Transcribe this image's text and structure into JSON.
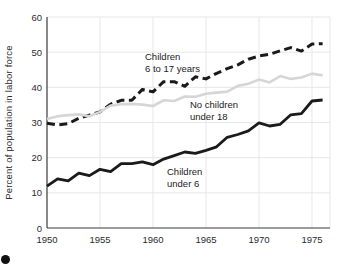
{
  "colors": {
    "background": "#ffffff",
    "grid": "#e7e7e7",
    "axis": "#3a3a3a",
    "tick_text": "#2b2b2b",
    "bullet": "#111111"
  },
  "chart_data": {
    "type": "line",
    "title": "",
    "xlabel": "",
    "ylabel": "Percent of population in labor force",
    "xlim": [
      1950,
      1976.7
    ],
    "ylim": [
      0,
      60
    ],
    "x_ticks": [
      1950,
      1955,
      1960,
      1965,
      1970,
      1975
    ],
    "y_ticks": [
      0,
      10,
      20,
      30,
      40,
      50,
      60
    ],
    "grid": true,
    "legend_position": "inline-annotations",
    "x": [
      1950,
      1951,
      1952,
      1953,
      1954,
      1955,
      1956,
      1957,
      1958,
      1959,
      1960,
      1961,
      1962,
      1963,
      1964,
      1965,
      1966,
      1967,
      1968,
      1969,
      1970,
      1971,
      1972,
      1973,
      1974,
      1975,
      1976
    ],
    "series": [
      {
        "name": "Children 6 to 17 years",
        "style": "dashed",
        "color": "#1a1a1a",
        "width": 3,
        "values": [
          29.8,
          29.3,
          29.7,
          31.2,
          32.1,
          33.0,
          35.2,
          36.3,
          36.3,
          39.4,
          38.7,
          41.6,
          41.6,
          40.3,
          43.0,
          42.4,
          44.0,
          45.3,
          46.4,
          48.0,
          48.9,
          49.4,
          50.4,
          51.3,
          50.3,
          52.3,
          52.4
        ]
      },
      {
        "name": "No children under 18",
        "style": "solid",
        "color": "#d6d6d6",
        "width": 2.6,
        "values": [
          31.0,
          31.8,
          32.1,
          32.3,
          31.8,
          33.0,
          34.8,
          35.2,
          35.3,
          35.1,
          34.7,
          36.3,
          36.1,
          37.4,
          37.3,
          38.2,
          38.5,
          38.8,
          40.4,
          41.0,
          42.2,
          41.4,
          43.2,
          42.4,
          42.8,
          43.9,
          43.4
        ]
      },
      {
        "name": "Children under 6",
        "style": "solid",
        "color": "#1a1a1a",
        "width": 2.8,
        "values": [
          11.9,
          14.0,
          13.4,
          15.6,
          14.9,
          16.7,
          16.0,
          18.3,
          18.3,
          18.8,
          18.0,
          19.6,
          20.6,
          21.6,
          21.2,
          22.1,
          23.1,
          25.8,
          26.6,
          27.6,
          29.9,
          29.0,
          29.5,
          32.2,
          32.5,
          36.1,
          36.4
        ]
      }
    ],
    "annotations": [
      {
        "id": "children-6-17",
        "line1": "Children",
        "line2": "6 to 17 years"
      },
      {
        "id": "no-children",
        "line1": "No children",
        "line2": "under 18"
      },
      {
        "id": "children-under-6",
        "line1": "Children",
        "line2": "under 6"
      }
    ]
  }
}
